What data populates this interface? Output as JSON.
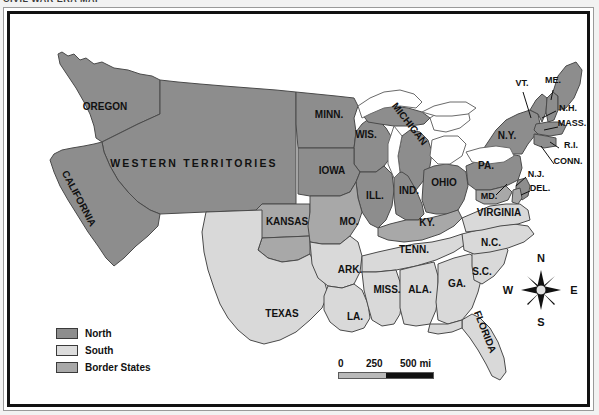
{
  "header": {
    "clipped_text": "CIVIL WAR ERA MAP"
  },
  "map": {
    "title_alt": "The United States on the Eve of the Civil War",
    "water_color": "#ffffff",
    "colors": {
      "north": "#8d8d8d",
      "south": "#d9d9d9",
      "border_states": "#a8a8a8",
      "outline": "#4a4a4a",
      "text": "#111111"
    },
    "labels": [
      {
        "name": "OREGON",
        "x": 95,
        "y": 96,
        "size": "md",
        "rotate": 0,
        "anchor": "middle"
      },
      {
        "name": "CALIFORNIA",
        "x": 66,
        "y": 186,
        "size": "md",
        "rotate": 62,
        "anchor": "middle"
      },
      {
        "name": "WESTERN TERRITORIES",
        "x": 184,
        "y": 153,
        "size": "wt",
        "rotate": 0,
        "anchor": "middle"
      },
      {
        "name": "KANSAS",
        "x": 277,
        "y": 211,
        "size": "md",
        "rotate": 0,
        "anchor": "middle"
      },
      {
        "name": "TEXAS",
        "x": 272,
        "y": 303,
        "size": "md",
        "rotate": 0,
        "anchor": "middle"
      },
      {
        "name": "MINN.",
        "x": 319,
        "y": 104,
        "size": "md",
        "rotate": 0,
        "anchor": "middle"
      },
      {
        "name": "WIS.",
        "x": 356,
        "y": 124,
        "size": "md",
        "rotate": 0,
        "anchor": "middle"
      },
      {
        "name": "MICHIGAN",
        "x": 397,
        "y": 112,
        "size": "md",
        "rotate": 52,
        "anchor": "middle"
      },
      {
        "name": "IOWA",
        "x": 322,
        "y": 160,
        "size": "md",
        "rotate": 0,
        "anchor": "middle"
      },
      {
        "name": "ILL.",
        "x": 365,
        "y": 185,
        "size": "md",
        "rotate": 0,
        "anchor": "middle"
      },
      {
        "name": "IND.",
        "x": 399,
        "y": 180,
        "size": "md",
        "rotate": 0,
        "anchor": "middle"
      },
      {
        "name": "OHIO",
        "x": 434,
        "y": 172,
        "size": "md",
        "rotate": 0,
        "anchor": "middle"
      },
      {
        "name": "MO.",
        "x": 339,
        "y": 211,
        "size": "md",
        "rotate": 0,
        "anchor": "middle"
      },
      {
        "name": "KY.",
        "x": 417,
        "y": 212,
        "size": "md",
        "rotate": 0,
        "anchor": "middle"
      },
      {
        "name": "PA.",
        "x": 476,
        "y": 155,
        "size": "md",
        "rotate": 0,
        "anchor": "middle"
      },
      {
        "name": "N.Y.",
        "x": 497,
        "y": 125,
        "size": "md",
        "rotate": 0,
        "anchor": "middle"
      },
      {
        "name": "VT.",
        "x": 512,
        "y": 72,
        "size": "sm",
        "rotate": 0,
        "anchor": "middle"
      },
      {
        "name": "ME.",
        "x": 543,
        "y": 69,
        "size": "sm",
        "rotate": 0,
        "anchor": "middle"
      },
      {
        "name": "N.H.",
        "x": 558,
        "y": 97,
        "size": "sm",
        "rotate": 0,
        "anchor": "middle"
      },
      {
        "name": "MASS.",
        "x": 562,
        "y": 112,
        "size": "sm",
        "rotate": 0,
        "anchor": "middle"
      },
      {
        "name": "R.I.",
        "x": 561,
        "y": 134,
        "size": "sm",
        "rotate": 0,
        "anchor": "middle"
      },
      {
        "name": "CONN.",
        "x": 558,
        "y": 150,
        "size": "sm",
        "rotate": 0,
        "anchor": "middle"
      },
      {
        "name": "N.J.",
        "x": 526,
        "y": 163,
        "size": "sm",
        "rotate": 0,
        "anchor": "middle"
      },
      {
        "name": "DEL.",
        "x": 530,
        "y": 177,
        "size": "sm",
        "rotate": 0,
        "anchor": "middle"
      },
      {
        "name": "MD.",
        "x": 479,
        "y": 185,
        "size": "sm",
        "rotate": 0,
        "anchor": "middle"
      },
      {
        "name": "VIRGINIA",
        "x": 489,
        "y": 202,
        "size": "md",
        "rotate": 0,
        "anchor": "middle"
      },
      {
        "name": "TENN.",
        "x": 404,
        "y": 239,
        "size": "md",
        "rotate": 0,
        "anchor": "middle"
      },
      {
        "name": "N.C.",
        "x": 481,
        "y": 232,
        "size": "md",
        "rotate": 0,
        "anchor": "middle"
      },
      {
        "name": "S.C.",
        "x": 472,
        "y": 261,
        "size": "md",
        "rotate": 0,
        "anchor": "middle"
      },
      {
        "name": "ARK.",
        "x": 340,
        "y": 259,
        "size": "md",
        "rotate": 0,
        "anchor": "middle"
      },
      {
        "name": "MISS.",
        "x": 377,
        "y": 279,
        "size": "md",
        "rotate": 0,
        "anchor": "middle"
      },
      {
        "name": "ALA.",
        "x": 410,
        "y": 279,
        "size": "md",
        "rotate": 0,
        "anchor": "middle"
      },
      {
        "name": "GA.",
        "x": 447,
        "y": 273,
        "size": "md",
        "rotate": 0,
        "anchor": "middle"
      },
      {
        "name": "LA.",
        "x": 345,
        "y": 306,
        "size": "md",
        "rotate": 0,
        "anchor": "middle"
      },
      {
        "name": "FLORIDA",
        "x": 472,
        "y": 319,
        "size": "md",
        "rotate": 68,
        "anchor": "middle"
      }
    ]
  },
  "legend": {
    "items": [
      {
        "label": "North",
        "color": "#8d8d8d"
      },
      {
        "label": "South",
        "color": "#dcdcdc"
      },
      {
        "label": "Border States",
        "color": "#a8a8a8"
      }
    ]
  },
  "scale": {
    "ticks": [
      "0",
      "250",
      "500 mi"
    ],
    "segment_a_color": "#b9b9b9",
    "segment_b_color": "#101010"
  },
  "compass": {
    "north": "N",
    "east": "E",
    "south": "S",
    "west": "W"
  }
}
